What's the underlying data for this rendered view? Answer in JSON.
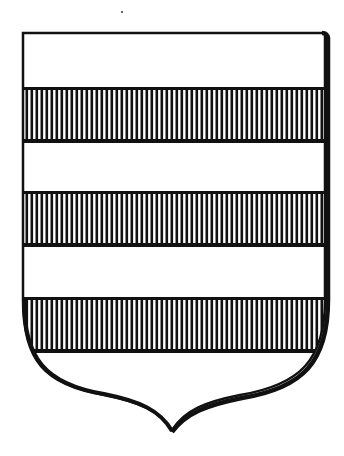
{
  "image": {
    "subject": "heraldic-shield",
    "description": "Escutcheon barry with three bars hatched vertically (gules) on a white (argent) field",
    "colors": {
      "ink": "#111111",
      "field": "#ffffff",
      "background": "#ffffff"
    },
    "shield": {
      "left": 22,
      "right": 326,
      "top": 32,
      "point_x": 172,
      "point_y": 432
    },
    "bands": [
      {
        "tincture": "argent",
        "y_top": 33,
        "y_bottom": 88
      },
      {
        "tincture": "gules-hatched",
        "y_top": 88,
        "y_bottom": 142
      },
      {
        "tincture": "argent",
        "y_top": 142,
        "y_bottom": 192
      },
      {
        "tincture": "gules-hatched",
        "y_top": 192,
        "y_bottom": 246
      },
      {
        "tincture": "argent",
        "y_top": 246,
        "y_bottom": 298
      },
      {
        "tincture": "gules-hatched",
        "y_top": 298,
        "y_bottom": 352
      },
      {
        "tincture": "argent",
        "y_top": 352,
        "y_bottom": 432
      }
    ],
    "hatch_spacing": 5,
    "dot": {
      "x": 122,
      "y": 12
    }
  }
}
